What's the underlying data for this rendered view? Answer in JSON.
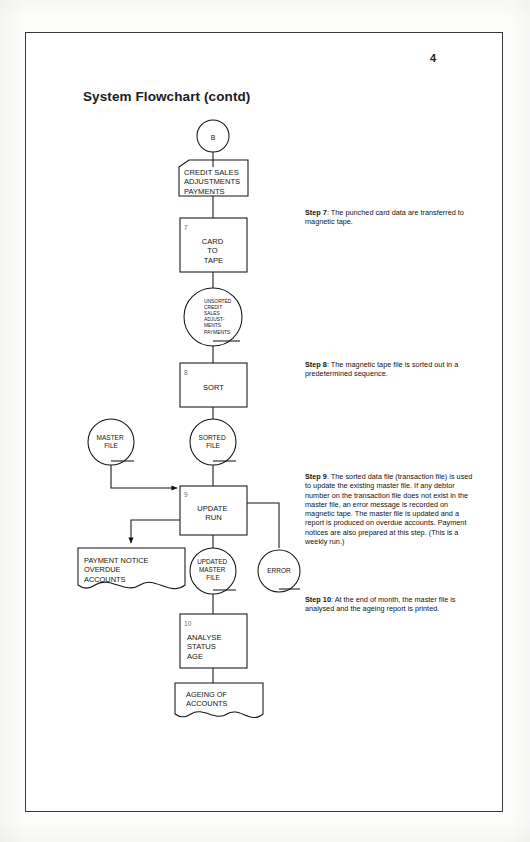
{
  "page": {
    "number": "4",
    "title": "System Flowchart (contd)"
  },
  "flowchart": {
    "nodes": {
      "connector_b": {
        "label": "B",
        "shape": "connector-circle"
      },
      "credit_sales_card": {
        "lines": [
          "CREDIT SALES",
          "ADJUSTMENTS",
          "PAYMENTS"
        ],
        "shape": "punched-card"
      },
      "card_to_tape": {
        "step": "7",
        "lines": [
          "CARD",
          "TO",
          "TAPE"
        ],
        "shape": "process"
      },
      "unsorted_tape": {
        "lines": [
          "UNSORTED",
          "CREDIT",
          "SALES",
          "ADJUST-",
          "MENTS",
          "PAYMENTS"
        ],
        "shape": "magnetic-tape"
      },
      "sort": {
        "step": "8",
        "lines": [
          "SORT"
        ],
        "shape": "process"
      },
      "master_file": {
        "lines": [
          "MASTER",
          "FILE"
        ],
        "shape": "magnetic-tape"
      },
      "sorted_file": {
        "lines": [
          "SORTED",
          "FILE"
        ],
        "shape": "magnetic-tape"
      },
      "update_run": {
        "step": "9",
        "lines": [
          "UPDATE",
          "RUN"
        ],
        "shape": "process"
      },
      "payment_notice": {
        "lines": [
          "PAYMENT NOTICE",
          "OVERDUE",
          "ACCOUNTS"
        ],
        "shape": "document"
      },
      "updated_master_file": {
        "lines": [
          "UPDATED",
          "MASTER",
          "FILE"
        ],
        "shape": "magnetic-tape"
      },
      "error_tape": {
        "lines": [
          "ERROR"
        ],
        "shape": "magnetic-tape"
      },
      "analyse": {
        "step": "10",
        "lines": [
          "ANALYSE",
          "STATUS",
          "AGE"
        ],
        "shape": "process"
      },
      "ageing_of_accounts": {
        "lines": [
          "AGEING OF",
          "ACCOUNTS"
        ],
        "shape": "document"
      }
    }
  },
  "steps": {
    "step7": {
      "label": "Step 7",
      "sep": ": ",
      "text": "The punched card data are transferred to magnetic tape."
    },
    "step8": {
      "label": "Step 8",
      "sep": ": ",
      "text": "The magnetic tape file is sorted out in a predetermined sequence."
    },
    "step9": {
      "label": "Step 9",
      "sep": ". ",
      "text": "The sorted data file (transaction file) is used to update the existing master file. If any debtor number on the transaction file does not exist in the master file, an error message is recorded on magnetic tape. The master file is updated and a report is produced on overdue accounts. Payment notices are also prepared at this step. (This is a weekly run.)"
    },
    "step10": {
      "label": "Step 10",
      "sep": ": ",
      "text": "At the end of month, the master file is analysed and the ageing report is printed."
    }
  },
  "colors": {
    "ink": "#141414",
    "rule": "#3a3a3a",
    "paper": "#ffffff"
  }
}
